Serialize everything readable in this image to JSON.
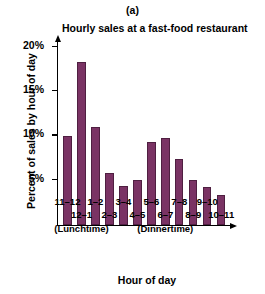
{
  "panel": {
    "label": "(a)"
  },
  "chart_data": {
    "type": "bar",
    "title": "Hourly sales at a fast-food restaurant",
    "xlabel": "Hour of day",
    "ylabel": "Percent of sales by hour of day",
    "ylim": [
      0,
      21
    ],
    "grid": false,
    "legend": null,
    "ytick_labels": [
      "20%",
      "15%",
      "10%",
      "5%"
    ],
    "ytick_values": [
      20,
      15,
      10,
      5
    ],
    "categories": [
      "11–12",
      "12–1",
      "1–2",
      "2–3",
      "3–4",
      "4–5",
      "5–6",
      "6–7",
      "7–8",
      "8–9",
      "9–10",
      "10–11"
    ],
    "values": [
      10.0,
      18.3,
      11.0,
      5.8,
      4.3,
      5.0,
      9.3,
      9.7,
      7.4,
      5.0,
      4.2,
      3.3
    ],
    "bar_color": "#7a3364",
    "bar_edge_color": "#4f1f41",
    "annotations": [
      {
        "text": "(Lunchtime)",
        "category_index": 1
      },
      {
        "text": "(Dinnertime)",
        "category_index": 7
      }
    ]
  }
}
